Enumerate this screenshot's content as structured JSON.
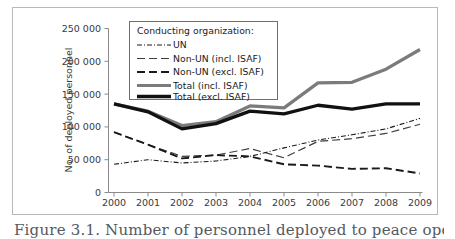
{
  "figure": {
    "caption": "Figure 3.1. Number of personnel deployed to peace operations, 2000-2009"
  },
  "chart_data": {
    "type": "line",
    "title": "",
    "xlabel": "",
    "ylabel": "No. of deployed personnel",
    "x": [
      2000,
      2001,
      2002,
      2003,
      2004,
      2005,
      2006,
      2007,
      2008,
      2009
    ],
    "xtick_labels": [
      "2000",
      "2001",
      "2002",
      "2003",
      "2004",
      "2005",
      "2006",
      "2007",
      "2008",
      "2009"
    ],
    "ytick_labels": [
      "0",
      "50 000",
      "100 000",
      "150 000",
      "200 000",
      "250 000"
    ],
    "ytick_values": [
      0,
      50000,
      100000,
      150000,
      200000,
      250000
    ],
    "ylim": [
      0,
      250000
    ],
    "xlim": [
      2000,
      2009
    ],
    "grid": false,
    "legend_position": "upper-left-inside",
    "legend_title": "Conducting organization:",
    "series": [
      {
        "name": "UN",
        "style": "dash-dot",
        "color": "#1a1a1a",
        "values": [
          43000,
          50000,
          45000,
          48000,
          55000,
          68000,
          80000,
          88000,
          97000,
          113000
        ]
      },
      {
        "name": "Non-UN (incl. ISAF)",
        "style": "long-dash",
        "color": "#3d3d3d",
        "values": [
          92000,
          73000,
          55000,
          57000,
          67000,
          53000,
          78000,
          82000,
          90000,
          104000
        ]
      },
      {
        "name": "Non-UN (excl. ISAF)",
        "style": "dash",
        "color": "#1a1a1a",
        "values": [
          92000,
          73000,
          52000,
          57000,
          55000,
          43000,
          41000,
          36000,
          37000,
          29000
        ]
      },
      {
        "name": "Total (incl. ISAF)",
        "style": "solid-thick",
        "color": "#7b7b7b",
        "values": [
          135000,
          124000,
          102000,
          108000,
          132000,
          129000,
          167000,
          168000,
          188000,
          218000
        ]
      },
      {
        "name": "Total (excl. ISAF)",
        "style": "solid-thick",
        "color": "#111111",
        "values": [
          135000,
          123000,
          97000,
          105000,
          124000,
          120000,
          133000,
          127000,
          135000,
          135000
        ]
      }
    ]
  }
}
